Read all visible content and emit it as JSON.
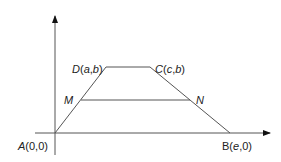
{
  "diagram": {
    "type": "trapezoid-on-axes",
    "points": {
      "A": {
        "label_name": "A",
        "label_coords": "(0,0)"
      },
      "B": {
        "label_name": "B",
        "label_coords": "(e,0)"
      },
      "C": {
        "label_name": "C",
        "label_coords": "(c,b)"
      },
      "D": {
        "label_name": "D",
        "label_coords": "(a,b)"
      },
      "M": {
        "label_name": "M"
      },
      "N": {
        "label_name": "N"
      }
    },
    "colors": {
      "line": "#555555",
      "axis": "#444444",
      "text": "#222222"
    }
  }
}
